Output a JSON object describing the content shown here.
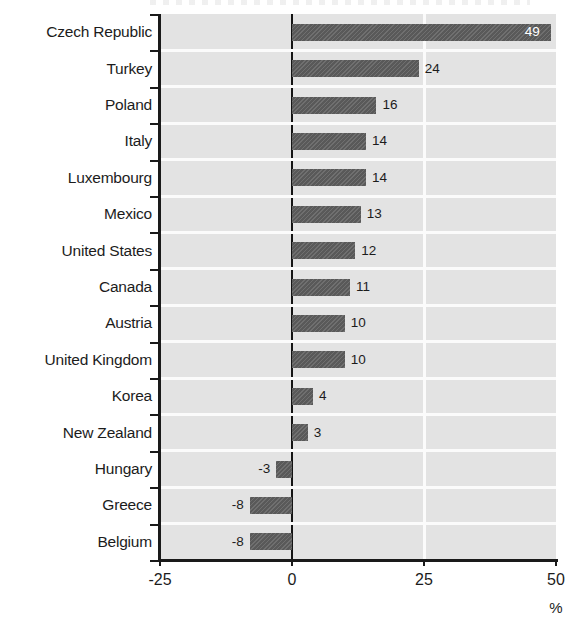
{
  "chart_data": {
    "type": "bar",
    "orientation": "horizontal",
    "title": "",
    "xlabel": "%",
    "ylabel": "",
    "xlim": [
      -25,
      50
    ],
    "xticks": [
      "-25",
      "0",
      "25",
      "50"
    ],
    "xtick_values": [
      -25,
      0,
      25,
      50
    ],
    "grid": true,
    "grid_orientation": "both",
    "legend": "none",
    "categories": [
      "Czech Republic",
      "Turkey",
      "Poland",
      "Italy",
      "Luxembourg",
      "Mexico",
      "United States",
      "Canada",
      "Austria",
      "United Kingdom",
      "Korea",
      "New Zealand",
      "Hungary",
      "Greece",
      "Belgium"
    ],
    "values": [
      49,
      24,
      16,
      14,
      14,
      13,
      12,
      11,
      10,
      10,
      4,
      3,
      -3,
      -8,
      -8
    ],
    "data_labels": [
      "49",
      "24",
      "16",
      "14",
      "14",
      "13",
      "12",
      "11",
      "10",
      "10",
      "4",
      "3",
      "-3",
      "-8",
      "-8"
    ],
    "bar_color": "#5e5e5e",
    "plot_background": "#e3e3e3",
    "gridline_color": "#fbfbfb",
    "axis_color": "#1a1a1a",
    "inside_label_color": "#ffffff"
  },
  "axis": {
    "unit_label": "%"
  }
}
